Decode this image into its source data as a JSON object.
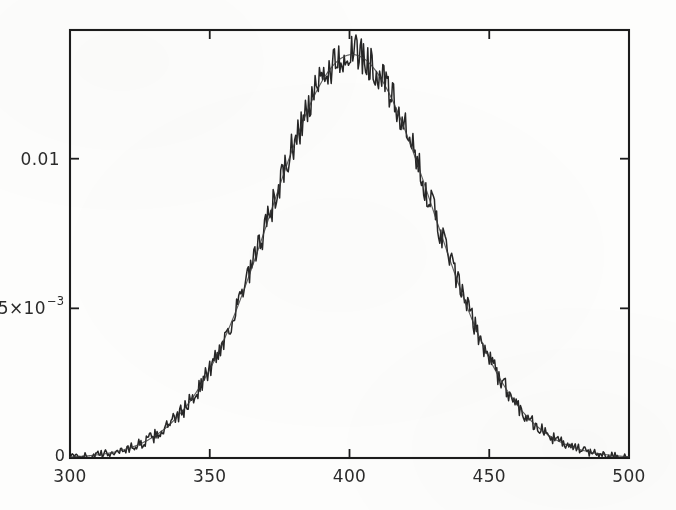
{
  "chart_data": {
    "type": "line",
    "title": "",
    "subtitle": "",
    "xlabel": "",
    "ylabel": "",
    "xlim": [
      300,
      500
    ],
    "ylim": [
      0,
      0.0143
    ],
    "grid": false,
    "legend": null,
    "legend_position": "none",
    "annotations": [],
    "x_ticks": [
      300,
      350,
      400,
      450,
      500
    ],
    "x_tick_labels": [
      "300",
      "350",
      "400",
      "450",
      "500"
    ],
    "y_ticks": [
      0,
      0.005,
      0.01
    ],
    "y_tick_labels": [
      "0",
      "5×10⁻³",
      "0.01"
    ],
    "y_tick_label_parts": [
      {
        "mantissa": "0",
        "base": "",
        "exponent": ""
      },
      {
        "mantissa": "5×10",
        "base": "",
        "exponent": "-3"
      },
      {
        "mantissa": "0.01",
        "base": "",
        "exponent": ""
      }
    ],
    "series": [
      {
        "name": "data",
        "color": "#1a1a1a",
        "style": "noisy-line",
        "peak_x": 401,
        "peak_y": 0.01352,
        "mean": 401,
        "sigma": 29.3,
        "x": [
          300,
          305,
          310,
          315,
          320,
          325,
          330,
          335,
          340,
          345,
          350,
          355,
          360,
          365,
          370,
          375,
          380,
          385,
          390,
          395,
          400,
          405,
          410,
          415,
          420,
          425,
          430,
          435,
          440,
          445,
          450,
          455,
          460,
          465,
          470,
          475,
          480,
          485,
          490,
          495,
          500
        ],
        "values": [
          7e-05,
          0.00012,
          0.00021,
          0.00035,
          0.00055,
          0.00086,
          0.00129,
          0.00187,
          0.00263,
          0.00357,
          0.0047,
          0.00599,
          0.00739,
          0.00884,
          0.01024,
          0.0115,
          0.01252,
          0.01322,
          0.01352,
          0.01348,
          0.01352,
          0.01322,
          0.01252,
          0.0115,
          0.01024,
          0.00884,
          0.00739,
          0.00599,
          0.0047,
          0.00357,
          0.00263,
          0.00187,
          0.00129,
          0.00086,
          0.00055,
          0.00035,
          0.00021,
          0.00012,
          7e-05,
          4e-05,
          3e-05
        ]
      },
      {
        "name": "fit",
        "color": "#3a3a3a",
        "style": "smooth-line",
        "peak_x": 401,
        "peak_y": 0.01348,
        "mean": 401,
        "sigma": 29.3,
        "x": [
          300,
          310,
          320,
          330,
          340,
          350,
          360,
          370,
          380,
          390,
          400,
          410,
          420,
          430,
          440,
          450,
          460,
          470,
          480,
          490,
          500
        ],
        "values": [
          7e-05,
          0.00021,
          0.00055,
          0.00129,
          0.00263,
          0.0047,
          0.00739,
          0.01024,
          0.01252,
          0.01348,
          0.01348,
          0.01252,
          0.01024,
          0.00739,
          0.0047,
          0.00263,
          0.00129,
          0.00055,
          0.00021,
          7e-05,
          3e-05
        ]
      }
    ]
  },
  "axes": {
    "frame_color": "#1c1c1c",
    "background_color": "#fdfdfc",
    "tick_color": "#1c1c1c",
    "origin_label": "0"
  }
}
